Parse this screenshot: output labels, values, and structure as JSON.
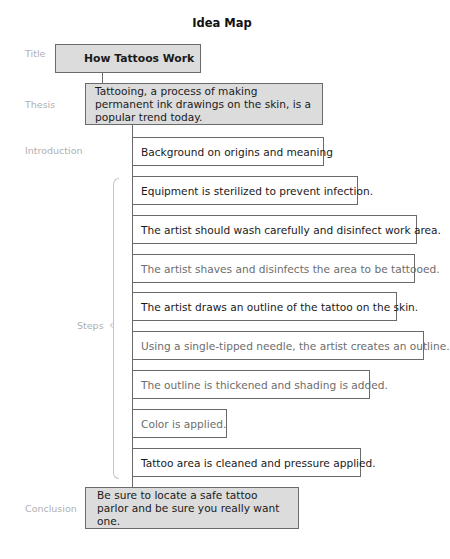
{
  "heading": "Idea Map",
  "labels": {
    "title": "Title",
    "thesis": "Thesis",
    "introduction": "Introduction",
    "steps": "Steps",
    "conclusion": "Conclusion"
  },
  "title_box": "How Tattoos Work",
  "thesis_box": "Tattooing, a process of making permanent ink drawings on the skin, is a popular trend today.",
  "introduction_box": "Background on origins and meaning",
  "steps": [
    "Equipment is sterilized to prevent infection.",
    "The artist should wash carefully and disinfect work area.",
    "The artist shaves and disinfects the area to be tattooed.",
    "The artist draws an outline of the tattoo on the skin.",
    "Using a single-tipped needle, the artist creates an outline.",
    "The outline is thickened and shading is added.",
    "Color is applied.",
    "Tattoo area is cleaned and pressure applied."
  ],
  "conclusion_box": "Be sure to locate a safe tattoo parlor and be sure you really want one.",
  "colors": {
    "shaded_box": "#dcdcdc",
    "border": "#6a6a6a",
    "label_text": "#b0b0b0",
    "light_step_text": "#6d6d6d"
  }
}
